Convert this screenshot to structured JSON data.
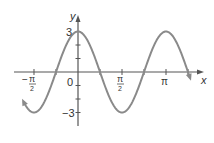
{
  "chart_data": {
    "type": "line",
    "title": "",
    "function": "y = 3cos(2x)",
    "xlabel": "x",
    "ylabel": "y",
    "x_ticks": [
      {
        "value": -1.5708,
        "label_num": "π",
        "label_den": "2",
        "sign": "−"
      },
      {
        "value": 0,
        "label": "0"
      },
      {
        "value": 1.5708,
        "label_num": "π",
        "label_den": "2",
        "sign": ""
      },
      {
        "value": 3.1416,
        "label": "π"
      }
    ],
    "y_ticks": [
      -3,
      -2,
      -1,
      1,
      2,
      3
    ],
    "y_tick_labels": [
      {
        "value": 3,
        "label": "3"
      },
      {
        "value": -3,
        "label": "−3"
      }
    ],
    "xlim": [
      -2.0,
      4.1
    ],
    "ylim": [
      -4.0,
      4.0
    ],
    "x_range_curve": [
      -1.95,
      4.0
    ],
    "amplitude": 3,
    "period": 3.1416,
    "series": [
      {
        "name": "3cos(2x)",
        "color": "#8a8a8a"
      }
    ],
    "grid": false,
    "legend": null
  },
  "labels": {
    "y_axis": "y",
    "x_axis": "x",
    "origin": "0",
    "y_max": "3",
    "y_min": "−3",
    "pi": "π",
    "two": "2",
    "minus": "−"
  }
}
